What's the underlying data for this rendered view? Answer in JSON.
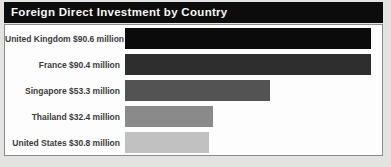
{
  "header": {
    "title": "Foreign Direct Investment by Country"
  },
  "chart_data": {
    "type": "bar",
    "orientation": "horizontal",
    "title": "Foreign Direct Investment by Country",
    "categories": [
      "United Kingdom",
      "France",
      "Singapore",
      "Thailand",
      "United States"
    ],
    "values": [
      90.6,
      90.4,
      53.3,
      32.4,
      30.8
    ],
    "value_unit": "million USD",
    "display_labels": [
      "United Kingdom $90.6 million",
      "France $90.4 million",
      "Singapore $53.3 million",
      "Thailand $32.4 million",
      "United States $30.8 million"
    ],
    "bar_colors": [
      "#0b0b0b",
      "#2e2e2e",
      "#535353",
      "#8a8a8a",
      "#c1c1c1"
    ],
    "xlabel": "",
    "ylabel": "",
    "axis": {
      "visible": false,
      "xlim": [
        0,
        95
      ]
    },
    "grid": false,
    "legend_position": "none"
  },
  "colors": {
    "page_bg": "#e3e3e1",
    "header_bg": "#0c0c0c",
    "header_text": "#f7f7f7",
    "panel_bg": "#fdfdfd",
    "panel_border": "#8c8c8c",
    "label_text": "#3b3b3b"
  }
}
